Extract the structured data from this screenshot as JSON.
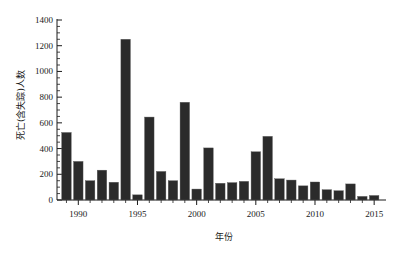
{
  "chart_data": {
    "type": "bar",
    "title": "",
    "subtitle": "",
    "xlabel": "年份",
    "ylabel": "死亡(含失踪)人数",
    "xlim": [
      1988.2,
      2016.0
    ],
    "ylim": [
      0,
      1400
    ],
    "grid": false,
    "legend": null,
    "y_ticks": [
      0,
      200,
      400,
      600,
      800,
      1000,
      1200,
      1400
    ],
    "y_tick_labels": [
      "0",
      "200",
      "400",
      "600",
      "800",
      "1000",
      "1200",
      "1400"
    ],
    "y_minor_tick_step": 50,
    "x_ticks": [
      1990,
      1995,
      2000,
      2005,
      2010,
      2015
    ],
    "x_tick_labels": [
      "1990",
      "1995",
      "2000",
      "2005",
      "2010",
      "2015"
    ],
    "categories": [
      1989,
      1990,
      1991,
      1992,
      1993,
      1994,
      1995,
      1996,
      1997,
      1998,
      1999,
      2000,
      2001,
      2002,
      2003,
      2004,
      2005,
      2006,
      2007,
      2008,
      2009,
      2010,
      2011,
      2012,
      2013,
      2014,
      2015
    ],
    "values": [
      525,
      300,
      150,
      232,
      138,
      1250,
      40,
      645,
      222,
      150,
      760,
      85,
      405,
      130,
      135,
      145,
      375,
      495,
      165,
      155,
      110,
      140,
      80,
      72,
      125,
      28,
      35
    ],
    "series": [
      {
        "name": "死亡(含失踪)人数",
        "values": [
          525,
          300,
          150,
          232,
          138,
          1250,
          40,
          645,
          222,
          150,
          760,
          85,
          405,
          130,
          135,
          145,
          375,
          495,
          165,
          155,
          110,
          140,
          80,
          72,
          125,
          28,
          35
        ]
      }
    ],
    "bar_color": "#2b2b2b",
    "bar_edge_color": "#555555"
  },
  "figure": {
    "background": "#ffffff",
    "axis_color": "#1a1a1a"
  }
}
